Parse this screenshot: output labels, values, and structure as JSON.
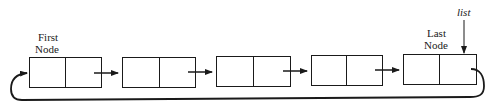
{
  "diagram": {
    "type": "circular singly linked list",
    "labels": {
      "first_line1": "First",
      "first_line2": "Node",
      "last_line1": "Last",
      "last_line2": "Node",
      "pointer": "list"
    },
    "nodes": [
      {
        "x": 29,
        "y": 57,
        "w": 72,
        "h": 30,
        "divider": 65
      },
      {
        "x": 122,
        "y": 57,
        "w": 73,
        "h": 30,
        "divider": 159
      },
      {
        "x": 216,
        "y": 56,
        "w": 74,
        "h": 30,
        "divider": 253
      },
      {
        "x": 311,
        "y": 55,
        "w": 71,
        "h": 30,
        "divider": 346
      },
      {
        "x": 403,
        "y": 54,
        "w": 73,
        "h": 30,
        "divider": 439
      }
    ],
    "colors": {
      "stroke": "#1a1a1a",
      "background": "#ffffff"
    }
  }
}
